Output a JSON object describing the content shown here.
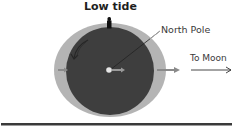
{
  "labels": {
    "low_tide": "Low tide",
    "north_pole": "North Pole",
    "to_moon": "To Moon"
  },
  "colors": {
    "earth": "#3e3e3e",
    "water": "#b4b4b4",
    "arrow_gray": "#9a9a9a",
    "baseline": "#3a3a3a",
    "text": "#333333"
  },
  "icons": {
    "person": "person-figure-icon",
    "rotation": "rotation-arrow-icon",
    "center": "center-force-arrow-icon",
    "left": "left-force-arrow-icon",
    "right": "right-force-arrow-icon",
    "moon_direction": "to-moon-arrow-icon"
  }
}
